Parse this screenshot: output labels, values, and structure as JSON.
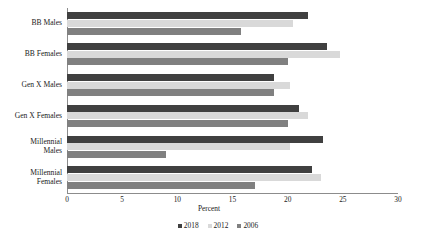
{
  "chart_data": {
    "type": "bar",
    "orientation": "horizontal",
    "title": "",
    "xlabel": "Percent",
    "ylabel": "",
    "xlim": [
      0,
      30
    ],
    "xticks": [
      0,
      5,
      10,
      15,
      20,
      25,
      30
    ],
    "grid": false,
    "legend_position": "bottom",
    "categories": [
      "BB Males",
      "BB Females",
      "Gen X Males",
      "Gen X Females",
      "Millennial Males",
      "Millennial Females"
    ],
    "series": [
      {
        "name": "2018",
        "color": "#404040",
        "values": [
          21.8,
          23.6,
          18.8,
          21.0,
          23.2,
          22.2
        ]
      },
      {
        "name": "2012",
        "color": "#d9d9d9",
        "values": [
          20.5,
          24.7,
          20.2,
          21.8,
          20.2,
          23.0
        ]
      },
      {
        "name": "2006",
        "color": "#808080",
        "values": [
          15.8,
          20.0,
          18.8,
          20.0,
          9.0,
          17.0
        ]
      }
    ]
  },
  "axis": {
    "x_title": "Percent",
    "tick_labels": [
      "0",
      "5",
      "10",
      "15",
      "20",
      "25",
      "30"
    ]
  },
  "legend": {
    "items": [
      {
        "label": "2018",
        "color": "#404040"
      },
      {
        "label": "2012",
        "color": "#d9d9d9"
      },
      {
        "label": "2006",
        "color": "#808080"
      }
    ]
  }
}
